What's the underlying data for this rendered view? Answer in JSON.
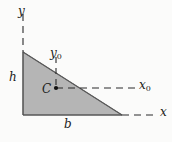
{
  "figure": {
    "background_color": "#fbfbfa",
    "fill_color": "#b5b5b5",
    "line_color": "#2a2a2a",
    "labels": {
      "y_axis": "y",
      "x_axis": "x",
      "height": "h",
      "base": "b",
      "centroid": "C",
      "x_centroid_base": "x",
      "x_centroid_sub": "0",
      "y_centroid_base": "y",
      "y_centroid_sub": "0"
    },
    "geometry": {
      "triangle_vertices": [
        [
          23,
          52
        ],
        [
          23,
          115
        ],
        [
          122,
          115
        ]
      ],
      "centroid_point": [
        56,
        88
      ],
      "y_axis_dash": {
        "x": 23,
        "y_top": 14,
        "y_bottom": 52
      },
      "x_axis_dash": {
        "y": 115,
        "x_left": 122,
        "x_right": 158
      },
      "x0_dash": {
        "y": 88,
        "x_left": 56,
        "x_right": 136
      },
      "y0_dash": {
        "x": 56,
        "y_top": 57,
        "y_bottom": 88
      }
    }
  }
}
